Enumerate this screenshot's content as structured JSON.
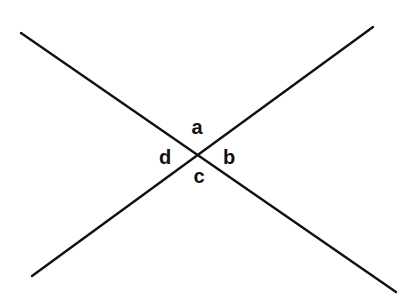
{
  "diagram": {
    "type": "intersecting-lines",
    "line_color": "#111111",
    "line_width": 2.4,
    "lines": [
      {
        "id": "line-1",
        "x1": 21,
        "y1": 33,
        "x2": 396,
        "y2": 292
      },
      {
        "id": "line-2",
        "x1": 32,
        "y1": 276,
        "x2": 373,
        "y2": 27
      }
    ],
    "intersection": {
      "x": 198,
      "y": 153
    },
    "labels": [
      {
        "id": "a",
        "text": "a",
        "x": 197,
        "y": 134
      },
      {
        "id": "b",
        "text": "b",
        "x": 229,
        "y": 164
      },
      {
        "id": "c",
        "text": "c",
        "x": 199,
        "y": 183
      },
      {
        "id": "d",
        "text": "d",
        "x": 165,
        "y": 164
      }
    ]
  }
}
